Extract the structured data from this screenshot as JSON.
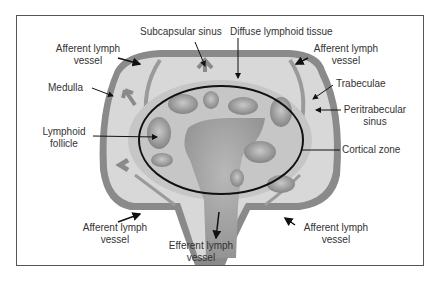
{
  "cut_caption": "page), and Sample Completed page (Section...",
  "labels": {
    "subcapsular_sinus": "Subcapsular sinus",
    "diffuse_lymphoid_tissue": "Diffuse lymphoid tissue",
    "afferent_top_left_1": "Afferent lymph",
    "afferent_top_left_2": "vessel",
    "afferent_top_right_1": "Afferent lymph",
    "afferent_top_right_2": "vessel",
    "medulla": "Medulla",
    "trabeculae": "Trabeculae",
    "peritrabecular_1": "Peritrabecular",
    "peritrabecular_2": "sinus",
    "lymphoid_1": "Lymphoid",
    "lymphoid_2": "follicle",
    "cortical_zone": "Cortical zone",
    "afferent_bottom_left_1": "Afferent lymph",
    "afferent_bottom_left_2": "vessel",
    "efferent_1": "Efferent lymph",
    "efferent_2": "vessel",
    "afferent_bottom_right_1": "Afferent lymph",
    "afferent_bottom_right_2": "vessel"
  },
  "colors": {
    "capsule": "#8a8a8a",
    "medulla_fill": "#d6d6d6",
    "cortex_fill": "#c4c4c4",
    "follicle": "#9a9a9a",
    "outline": "#111111"
  }
}
